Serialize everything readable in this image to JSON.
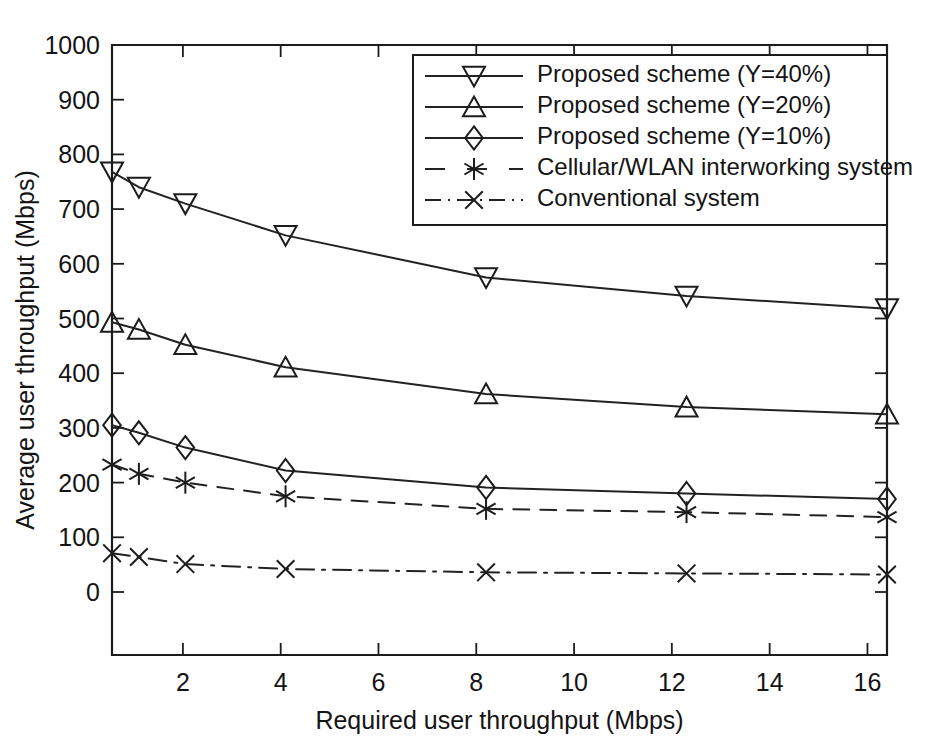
{
  "chart_data": {
    "type": "line",
    "title": "",
    "xlabel": "Required user throughput (Mbps)",
    "ylabel": "Average user throughput (Mbps)",
    "xlim": [
      0.55,
      16.4
    ],
    "ylim": [
      0,
      1000
    ],
    "xticks": [
      2,
      4,
      6,
      8,
      10,
      12,
      14,
      16
    ],
    "xticklabels": [
      "2",
      "4",
      "6",
      "8",
      "10",
      "12",
      "14",
      "16"
    ],
    "yticks": [
      0,
      100,
      200,
      300,
      400,
      500,
      600,
      700,
      800,
      900,
      1000
    ],
    "yticklabels": [
      "0",
      "100",
      "200",
      "300",
      "400",
      "500",
      "600",
      "700",
      "800",
      "900",
      "1000"
    ],
    "grid": false,
    "legend_position": "upper right",
    "x": [
      0.55,
      1.1,
      2.05,
      4.1,
      8.2,
      12.3,
      16.4
    ],
    "series": [
      {
        "name": "Proposed scheme (Y=40%)",
        "marker": "triangle-down",
        "linestyle": "solid",
        "color": "#1c1c1c",
        "values": [
          768,
          740,
          710,
          652,
          575,
          541,
          518
        ]
      },
      {
        "name": "Proposed scheme (Y=20%)",
        "marker": "triangle-up",
        "linestyle": "solid",
        "color": "#1c1c1c",
        "values": [
          493,
          480,
          452,
          411,
          362,
          338,
          325
        ]
      },
      {
        "name": "Proposed scheme (Y=10%)",
        "marker": "diamond",
        "linestyle": "solid",
        "color": "#1c1c1c",
        "values": [
          305,
          291,
          264,
          222,
          191,
          180,
          170
        ]
      },
      {
        "name": "Cellular/WLAN interworking system",
        "marker": "asterisk",
        "linestyle": "dashed",
        "color": "#1c1c1c",
        "values": [
          233,
          216,
          200,
          175,
          152,
          146,
          137
        ]
      },
      {
        "name": "Conventional system",
        "marker": "x",
        "linestyle": "dashdot",
        "color": "#1c1c1c",
        "values": [
          71,
          64,
          51,
          42,
          36,
          34,
          32
        ]
      }
    ]
  },
  "legend": {
    "entries": [
      "Proposed scheme (Y=40%)",
      "Proposed scheme (Y=20%)",
      "Proposed scheme (Y=10%)",
      "Cellular/WLAN interworking system",
      "Conventional system"
    ]
  }
}
